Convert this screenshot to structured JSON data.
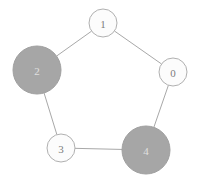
{
  "figure": {
    "title": "",
    "background_color": "#ffffff",
    "width": 200,
    "height": 179
  },
  "chart_data": {
    "type": "diagram",
    "diagram_type": "node-link-graph",
    "title": "",
    "xlabel": "",
    "ylabel": "",
    "grid": false,
    "legend": null,
    "layout": "circular",
    "directed": false,
    "node_ids": [
      "0",
      "1",
      "2",
      "3",
      "4"
    ],
    "edges": [
      {
        "source": "0",
        "target": "1"
      },
      {
        "source": "1",
        "target": "2"
      },
      {
        "source": "2",
        "target": "3"
      },
      {
        "source": "3",
        "target": "4"
      },
      {
        "source": "4",
        "target": "0"
      }
    ],
    "edge_color": "#a8a8a8",
    "edge_width": 1,
    "node_sizes": {
      "0": 14,
      "1": 14,
      "2": 24,
      "3": 14,
      "4": 24
    },
    "node_values": {
      "0": 1,
      "1": 1,
      "2": 3,
      "3": 1,
      "4": 3
    },
    "highlighted_nodes": [
      "2",
      "4"
    ],
    "palette": {
      "node_fill_default": "#fcfcfc",
      "node_fill_highlight": "#a6a6a6",
      "node_border": "#b0b0b0",
      "label_default": "#808080",
      "label_highlight": "#e8e8e8"
    }
  },
  "nodes": [
    {
      "id": "node-0",
      "label": "0",
      "cx": 173,
      "cy": 72,
      "r": 14,
      "fill": "#fcfcfc",
      "stroke": "#b0b0b0",
      "label_color": "#7d7d7d",
      "font_size": 11
    },
    {
      "id": "node-1",
      "label": "1",
      "cx": 103,
      "cy": 23,
      "r": 14,
      "fill": "#fcfcfc",
      "stroke": "#b0b0b0",
      "label_color": "#7d7d7d",
      "font_size": 11
    },
    {
      "id": "node-2",
      "label": "2",
      "cx": 37,
      "cy": 70,
      "r": 24,
      "fill": "#a6a6a6",
      "stroke": "#a0a0a0",
      "label_color": "#e0e0e0",
      "font_size": 11
    },
    {
      "id": "node-3",
      "label": "3",
      "cx": 61,
      "cy": 148,
      "r": 14,
      "fill": "#fcfcfc",
      "stroke": "#b0b0b0",
      "label_color": "#7d7d7d",
      "font_size": 11
    },
    {
      "id": "node-4",
      "label": "4",
      "cx": 146,
      "cy": 150,
      "r": 24,
      "fill": "#a6a6a6",
      "stroke": "#a0a0a0",
      "label_color": "#e0e0e0",
      "font_size": 11
    }
  ],
  "edges": [
    {
      "id": "edge-1-0",
      "x1": 103,
      "y1": 23,
      "x2": 173,
      "y2": 72
    },
    {
      "id": "edge-1-2",
      "x1": 103,
      "y1": 23,
      "x2": 37,
      "y2": 70
    },
    {
      "id": "edge-2-3",
      "x1": 37,
      "y1": 70,
      "x2": 61,
      "y2": 148
    },
    {
      "id": "edge-3-4",
      "x1": 61,
      "y1": 148,
      "x2": 146,
      "y2": 150
    },
    {
      "id": "edge-4-0",
      "x1": 146,
      "y1": 150,
      "x2": 173,
      "y2": 72
    }
  ]
}
